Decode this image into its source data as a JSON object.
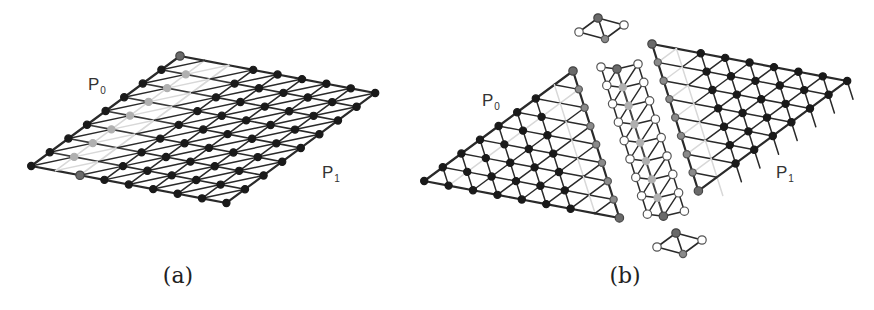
{
  "panels": [
    {
      "id": "a",
      "caption": "(a)",
      "region_labels": [
        {
          "name": "P",
          "subscript": "0",
          "x": 88,
          "y": 90
        },
        {
          "name": "P",
          "subscript": "1",
          "x": 322,
          "y": 178
        }
      ]
    },
    {
      "id": "b",
      "caption": "(b)",
      "region_labels": [
        {
          "name": "P",
          "subscript": "0",
          "x": 482,
          "y": 106
        },
        {
          "name": "P",
          "subscript": "1",
          "x": 776,
          "y": 178
        }
      ]
    }
  ],
  "colors": {
    "edge": "#2a2a2a",
    "seam_edge": "#d8d8d8",
    "interior_node": "#1a1a1a",
    "boundary_node": "#8a8a8a",
    "corner_node": "#6a6a6a",
    "ghost_node_fill": "#ffffff",
    "ghost_node_stroke": "#555555"
  }
}
